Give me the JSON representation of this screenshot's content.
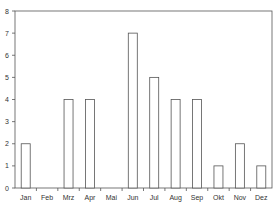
{
  "chart_data": {
    "type": "bar",
    "title": "",
    "xlabel": "",
    "ylabel": "",
    "categories": [
      "Jan",
      "Feb",
      "Mrz",
      "Apr",
      "Mai",
      "Jun",
      "Jul",
      "Aug",
      "Sep",
      "Okt",
      "Nov",
      "Dez"
    ],
    "values": [
      2,
      0,
      4,
      4,
      0,
      7,
      5,
      4,
      4,
      1,
      2,
      1
    ],
    "ylim": [
      0,
      8
    ],
    "yticks": [
      0,
      1,
      2,
      3,
      4,
      5,
      6,
      7,
      8
    ],
    "grid": false,
    "legend": null,
    "colors": {
      "bar_fill": "#ffffff",
      "bar_stroke": "#555555",
      "axis": "#555555"
    }
  }
}
